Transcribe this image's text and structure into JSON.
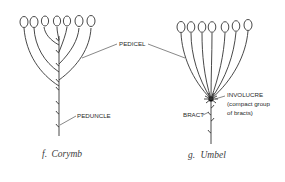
{
  "figure": {
    "corymb": {
      "caption_letter": "f.",
      "caption_name": "Corymb",
      "labels": {
        "pedicel": "PEDICEL",
        "peduncle": "PEDUNCLE"
      },
      "flower_count": 7
    },
    "umbel": {
      "caption_letter": "g.",
      "caption_name": "Umbel",
      "labels": {
        "involucre": "INVOLUCRE",
        "involucre_note_1": "(compact group",
        "involucre_note_2": "of bracts)",
        "bract": "BRACT"
      },
      "flower_count": 7
    }
  }
}
